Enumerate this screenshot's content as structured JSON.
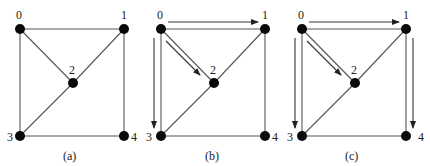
{
  "figure": {
    "panels": [
      {
        "id": "a",
        "caption": "(a)",
        "nodes": [
          {
            "id": "0",
            "label": "0"
          },
          {
            "id": "1",
            "label": "1"
          },
          {
            "id": "2",
            "label": "2"
          },
          {
            "id": "3",
            "label": "3"
          },
          {
            "id": "4",
            "label": "4"
          }
        ],
        "edges": [
          [
            "0",
            "1"
          ],
          [
            "0",
            "3"
          ],
          [
            "0",
            "2"
          ],
          [
            "1",
            "2"
          ],
          [
            "1",
            "4"
          ],
          [
            "2",
            "3"
          ],
          [
            "3",
            "4"
          ]
        ],
        "arrows": []
      },
      {
        "id": "b",
        "caption": "(b)",
        "nodes": [
          {
            "id": "0",
            "label": "0"
          },
          {
            "id": "1",
            "label": "1"
          },
          {
            "id": "2",
            "label": "2"
          },
          {
            "id": "3",
            "label": "3"
          },
          {
            "id": "4",
            "label": "4"
          }
        ],
        "edges": [
          [
            "0",
            "1"
          ],
          [
            "0",
            "3"
          ],
          [
            "0",
            "2"
          ],
          [
            "1",
            "2"
          ],
          [
            "1",
            "4"
          ],
          [
            "2",
            "3"
          ],
          [
            "3",
            "4"
          ]
        ],
        "arrows": [
          [
            "0",
            "1"
          ],
          [
            "0",
            "2"
          ],
          [
            "0",
            "3"
          ]
        ]
      },
      {
        "id": "c",
        "caption": "(c)",
        "nodes": [
          {
            "id": "0",
            "label": "0"
          },
          {
            "id": "1",
            "label": "1"
          },
          {
            "id": "2",
            "label": "2"
          },
          {
            "id": "3",
            "label": "3"
          },
          {
            "id": "4",
            "label": "4"
          }
        ],
        "edges": [
          [
            "0",
            "1"
          ],
          [
            "0",
            "3"
          ],
          [
            "0",
            "2"
          ],
          [
            "1",
            "2"
          ],
          [
            "1",
            "4"
          ],
          [
            "2",
            "3"
          ],
          [
            "3",
            "4"
          ]
        ],
        "arrows": [
          [
            "0",
            "1"
          ],
          [
            "0",
            "2"
          ],
          [
            "0",
            "3"
          ],
          [
            "1",
            "4"
          ]
        ]
      }
    ]
  }
}
